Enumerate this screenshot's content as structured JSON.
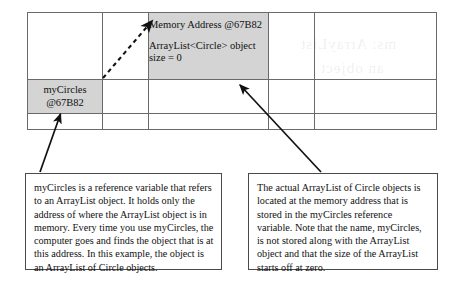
{
  "diagram": {
    "shade_color": "#d4d4d4",
    "line_color": "#6a6a6a"
  },
  "memory_table": {
    "rows": 3,
    "columns": 5,
    "cells": {
      "heap_object": {
        "heading": "Memory Address\n@67B82",
        "body": "ArrayList<Circle> object\nsize = 0"
      },
      "stack_variable": {
        "text": "myCircles\n@67B82"
      }
    }
  },
  "callouts": {
    "left": {
      "text": "myCircles is a reference variable that refers to an ArrayList object. It holds only the address of where the ArrayList object is in memory. Every time you use myCircles, the computer goes and finds the object that is at this address. In this example, the object is an ArrayList of Circle objects."
    },
    "right": {
      "text": "The actual ArrayList of Circle objects is located at the memory address that is stored in the myCircles reference variable. Note that the name, myCircles, is not stored along with the ArrayList object and that the size of the ArrayList starts off at zero."
    }
  },
  "arrows": {
    "reference_arrow": "dashed-arrow-variable-to-object",
    "left_callout_arrow": "solid-arrow-to-variable-cell",
    "right_callout_arrow": "solid-arrow-to-object-cell"
  }
}
